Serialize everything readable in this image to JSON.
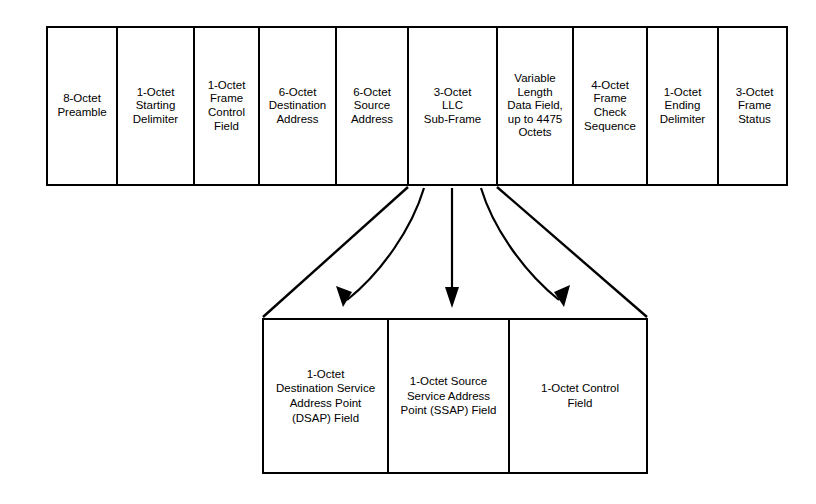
{
  "diagram": {
    "line_color": "#000000",
    "background_color": "#ffffff",
    "mac_frame": {
      "name": "mac-frame",
      "fields": [
        {
          "label": "8-Octet\nPreamble",
          "width_px": 70
        },
        {
          "label": "1-Octet\nStarting\nDelimiter",
          "width_px": 77
        },
        {
          "label": "1-Octet\nFrame\nControl\nField",
          "width_px": 65
        },
        {
          "label": "6-Octet\nDestination\nAddress",
          "width_px": 77
        },
        {
          "label": "6-Octet\nSource\nAddress",
          "width_px": 72
        },
        {
          "label": "3-Octet\nLLC\nSub-Frame",
          "width_px": 89
        },
        {
          "label": "Variable\nLength\nData Field,\nup to 4475\nOctets",
          "width_px": 76
        },
        {
          "label": "4-Octet\nFrame\nCheck\nSequence",
          "width_px": 74
        },
        {
          "label": "1-Octet\nEnding\nDelimiter",
          "width_px": 71
        },
        {
          "label": "3-Octet\nFrame\nStatus",
          "width_px": 71
        }
      ]
    },
    "llc_frame": {
      "name": "llc-sub-frame",
      "fields": [
        {
          "label": "1-Octet\nDestination Service\nAddress Point\n(DSAP) Field",
          "width_px": 125
        },
        {
          "label": "1-Octet Source\nService Address\nPoint (SSAP) Field",
          "width_px": 121
        },
        {
          "label": "1-Octet Control\nField",
          "width_px": 140
        }
      ]
    },
    "expansion": {
      "name": "expansion-funnel",
      "source_field": "3-Octet LLC Sub-Frame",
      "target_frame": "llc-sub-frame",
      "arrow_count": 3
    }
  }
}
